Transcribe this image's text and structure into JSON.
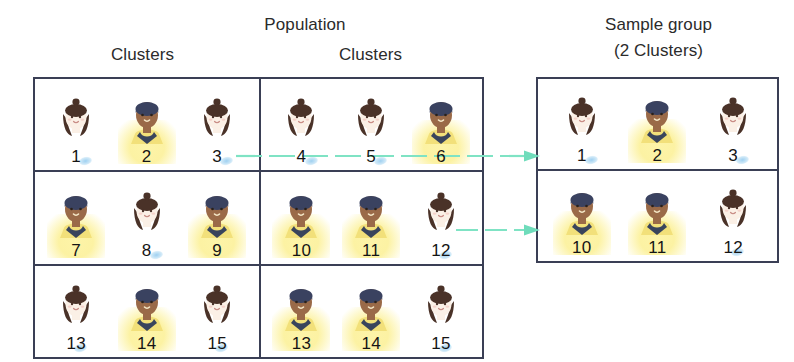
{
  "headers": {
    "population_title": "Population",
    "clusters_label_left": "Clusters",
    "clusters_label_right": "Clusters",
    "sample_title": "Sample group",
    "sample_subtitle": "(2 Clusters)"
  },
  "colors": {
    "border": "#3a3f55",
    "highlight_glow": "#fdf4a8",
    "arrow": "#7fe3c4",
    "text": "#231f20",
    "skin_light": "#fbf0e6",
    "skin_dark": "#9a6a48",
    "hair_brown": "#4a3228",
    "hair_navy": "#3a4260",
    "shirt_navy": "#39445c",
    "shirt_yellow": "#f2e07a",
    "smudge_blue": "#8ec8ee"
  },
  "population": {
    "columns": [
      {
        "name": "left-clusters",
        "rows": [
          {
            "cluster_id": 1,
            "people": [
              {
                "number": "1",
                "highlighted": false,
                "hair": "brown-bun",
                "skin": "light",
                "shirt": "light"
              },
              {
                "number": "2",
                "highlighted": true,
                "hair": "navy-short",
                "skin": "dark",
                "shirt": "yellow"
              },
              {
                "number": "3",
                "highlighted": false,
                "hair": "brown-bun",
                "skin": "light",
                "shirt": "light"
              }
            ]
          },
          {
            "cluster_id": 3,
            "people": [
              {
                "number": "7",
                "highlighted": true,
                "hair": "navy-short",
                "skin": "dark",
                "shirt": "yellow"
              },
              {
                "number": "8",
                "highlighted": false,
                "hair": "brown-bun",
                "skin": "light",
                "shirt": "light"
              },
              {
                "number": "9",
                "highlighted": true,
                "hair": "navy-short",
                "skin": "dark",
                "shirt": "yellow"
              }
            ]
          },
          {
            "cluster_id": 5,
            "people": [
              {
                "number": "13",
                "highlighted": false,
                "hair": "brown-bun",
                "skin": "light",
                "shirt": "light"
              },
              {
                "number": "14",
                "highlighted": true,
                "hair": "navy-short",
                "skin": "dark",
                "shirt": "yellow"
              },
              {
                "number": "15",
                "highlighted": false,
                "hair": "brown-bun",
                "skin": "light",
                "shirt": "light"
              }
            ]
          }
        ]
      },
      {
        "name": "right-clusters",
        "rows": [
          {
            "cluster_id": 2,
            "people": [
              {
                "number": "4",
                "highlighted": false,
                "hair": "brown-bun",
                "skin": "light",
                "shirt": "light"
              },
              {
                "number": "5",
                "highlighted": false,
                "hair": "brown-bun",
                "skin": "light",
                "shirt": "light"
              },
              {
                "number": "6",
                "highlighted": true,
                "hair": "navy-short",
                "skin": "dark",
                "shirt": "yellow"
              }
            ]
          },
          {
            "cluster_id": 4,
            "people": [
              {
                "number": "10",
                "highlighted": true,
                "hair": "navy-short",
                "skin": "dark",
                "shirt": "yellow"
              },
              {
                "number": "11",
                "highlighted": true,
                "hair": "navy-short",
                "skin": "dark",
                "shirt": "yellow"
              },
              {
                "number": "12",
                "highlighted": false,
                "hair": "brown-bun",
                "skin": "light",
                "shirt": "light"
              }
            ]
          },
          {
            "cluster_id": 6,
            "people": [
              {
                "number": "13",
                "highlighted": true,
                "hair": "navy-short",
                "skin": "dark",
                "shirt": "yellow"
              },
              {
                "number": "14",
                "highlighted": true,
                "hair": "navy-short",
                "skin": "dark",
                "shirt": "yellow"
              },
              {
                "number": "15",
                "highlighted": false,
                "hair": "brown-bun",
                "skin": "light",
                "shirt": "light"
              }
            ]
          }
        ]
      }
    ]
  },
  "sample_group": {
    "rows": [
      {
        "cluster_id": 1,
        "people": [
          {
            "number": "1",
            "highlighted": false,
            "hair": "brown-bun",
            "skin": "light",
            "shirt": "light"
          },
          {
            "number": "2",
            "highlighted": true,
            "hair": "navy-short",
            "skin": "dark",
            "shirt": "yellow"
          },
          {
            "number": "3",
            "highlighted": false,
            "hair": "brown-bun",
            "skin": "light",
            "shirt": "light"
          }
        ]
      },
      {
        "cluster_id": 4,
        "people": [
          {
            "number": "10",
            "highlighted": true,
            "hair": "navy-short",
            "skin": "dark",
            "shirt": "yellow"
          },
          {
            "number": "11",
            "highlighted": true,
            "hair": "navy-short",
            "skin": "dark",
            "shirt": "yellow"
          },
          {
            "number": "12",
            "highlighted": false,
            "hair": "brown-bun",
            "skin": "light",
            "shirt": "light"
          }
        ]
      }
    ]
  },
  "arrows": [
    {
      "name": "arrow-cluster-1",
      "from": "population-cluster-1",
      "to": "sample-cluster-1"
    },
    {
      "name": "arrow-cluster-2",
      "from": "population-cluster-4",
      "to": "sample-cluster-4"
    }
  ]
}
